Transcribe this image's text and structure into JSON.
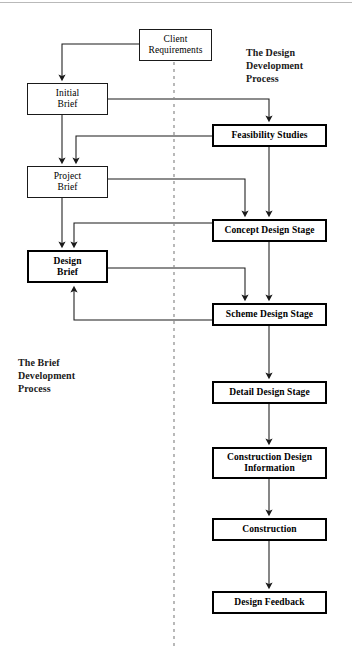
{
  "diagram": {
    "title_absent": true,
    "captions": [
      {
        "id": "design-development",
        "text": "The Design\nDevelopment\nProcess",
        "x": 246,
        "y": 46
      },
      {
        "id": "brief-development",
        "text": "The Brief\nDevelopment\nProcess",
        "x": 18,
        "y": 356
      }
    ],
    "nodes": [
      {
        "id": "client-requirements",
        "label": "Client\nRequirements",
        "x": 139,
        "y": 29,
        "w": 73,
        "h": 32,
        "style": "thin"
      },
      {
        "id": "initial-brief",
        "label": "Initial\nBrief",
        "x": 27,
        "y": 83,
        "w": 81,
        "h": 32,
        "style": "thin"
      },
      {
        "id": "project-brief",
        "label": "Project\nBrief",
        "x": 27,
        "y": 166,
        "w": 81,
        "h": 32,
        "style": "thin"
      },
      {
        "id": "design-brief",
        "label": "Design\nBrief",
        "x": 27,
        "y": 250,
        "w": 81,
        "h": 33,
        "style": "thick"
      },
      {
        "id": "feasibility-studies",
        "label": "Feasibility Studies",
        "x": 212,
        "y": 124,
        "w": 115,
        "h": 23,
        "style": "thick"
      },
      {
        "id": "concept-design-stage",
        "label": "Concept Design Stage",
        "x": 212,
        "y": 219,
        "w": 115,
        "h": 23,
        "style": "thick"
      },
      {
        "id": "scheme-design-stage",
        "label": "Scheme Design Stage",
        "x": 212,
        "y": 303,
        "w": 115,
        "h": 23,
        "style": "thick"
      },
      {
        "id": "detail-design-stage",
        "label": "Detail Design Stage",
        "x": 212,
        "y": 381,
        "w": 115,
        "h": 23,
        "style": "thick"
      },
      {
        "id": "construction-design-information",
        "label": "Construction Design\nInformation",
        "x": 212,
        "y": 447,
        "w": 115,
        "h": 32,
        "style": "thick"
      },
      {
        "id": "construction",
        "label": "Construction",
        "x": 212,
        "y": 518,
        "w": 115,
        "h": 23,
        "style": "thick"
      },
      {
        "id": "design-feedback",
        "label": "Design Feedback",
        "x": 212,
        "y": 591,
        "w": 115,
        "h": 23,
        "style": "thick"
      }
    ],
    "edges": [
      {
        "id": "client-requirements-to-initial-brief",
        "from": "client-requirements",
        "to": "initial-brief",
        "kind": "elbow-left-down"
      },
      {
        "id": "initial-brief-to-project-brief",
        "from": "initial-brief",
        "to": "project-brief",
        "kind": "straight-down"
      },
      {
        "id": "initial-brief-to-feasibility-studies",
        "from": "initial-brief",
        "to": "feasibility-studies",
        "kind": "elbow-right-down"
      },
      {
        "id": "feasibility-studies-to-project-brief",
        "from": "feasibility-studies",
        "to": "project-brief",
        "kind": "feedback-left-down"
      },
      {
        "id": "feasibility-studies-to-concept-design",
        "from": "feasibility-studies",
        "to": "concept-design-stage",
        "kind": "straight-down"
      },
      {
        "id": "project-brief-to-design-brief",
        "from": "project-brief",
        "to": "design-brief",
        "kind": "straight-down"
      },
      {
        "id": "project-brief-to-concept-design",
        "from": "project-brief",
        "to": "concept-design-stage",
        "kind": "elbow-right-down"
      },
      {
        "id": "concept-design-to-design-brief",
        "from": "concept-design-stage",
        "to": "design-brief",
        "kind": "feedback-left-down"
      },
      {
        "id": "concept-design-to-scheme-design",
        "from": "concept-design-stage",
        "to": "scheme-design-stage",
        "kind": "straight-down"
      },
      {
        "id": "design-brief-to-scheme-design",
        "from": "design-brief",
        "to": "scheme-design-stage",
        "kind": "elbow-right-down"
      },
      {
        "id": "scheme-design-to-design-brief",
        "from": "scheme-design-stage",
        "to": "design-brief",
        "kind": "feedback-left-up"
      },
      {
        "id": "scheme-design-to-detail-design",
        "from": "scheme-design-stage",
        "to": "detail-design-stage",
        "kind": "straight-down"
      },
      {
        "id": "detail-design-to-construction-info",
        "from": "detail-design-stage",
        "to": "construction-design-information",
        "kind": "straight-down"
      },
      {
        "id": "construction-info-to-construction",
        "from": "construction-design-information",
        "to": "construction",
        "kind": "straight-down"
      },
      {
        "id": "construction-to-design-feedback",
        "from": "construction",
        "to": "design-feedback",
        "kind": "straight-down"
      }
    ],
    "divider": {
      "id": "process-divider",
      "orientation": "vertical",
      "x": 174,
      "y1": 62,
      "y2": 648,
      "style": "dashed"
    },
    "colors": {
      "line": "#1a1a1a",
      "box_border": "#000000",
      "text": "#000000",
      "background": "#ffffff",
      "divider": "#8a8a8a"
    }
  }
}
